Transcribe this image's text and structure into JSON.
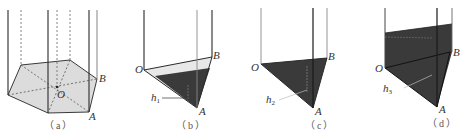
{
  "figure": {
    "colors": {
      "line": "#3a3a3a",
      "light_line": "#8a8a8a",
      "base_fill": "#d9d9d9",
      "water_fill": "#3b3b3b",
      "light_water": "#e6e6e6"
    },
    "panels": [
      {
        "id": "a",
        "caption": "（a）",
        "labels": {
          "O": "O",
          "A": "A",
          "B": "B"
        }
      },
      {
        "id": "b",
        "caption": "（b）",
        "labels": {
          "O": "O",
          "A": "A",
          "B": "B",
          "h": "h",
          "h_sub": "1"
        }
      },
      {
        "id": "c",
        "caption": "（c）",
        "labels": {
          "O": "O",
          "A": "A",
          "B": "B",
          "h": "h",
          "h_sub": "2"
        }
      },
      {
        "id": "d",
        "caption": "（d）",
        "labels": {
          "O": "O",
          "A": "A",
          "B": "B",
          "h": "h",
          "h_sub": "3"
        }
      }
    ]
  }
}
